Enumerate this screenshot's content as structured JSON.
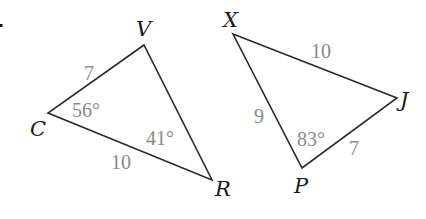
{
  "diagram": {
    "marker": ".",
    "triangles": [
      {
        "name": "CVR",
        "vertices": {
          "V": {
            "label": "V",
            "x": 144,
            "y": 45
          },
          "C": {
            "label": "C",
            "x": 48,
            "y": 113
          },
          "R": {
            "label": "R",
            "x": 212,
            "y": 180
          }
        },
        "sides": {
          "CV": {
            "label": "7"
          },
          "CR": {
            "label": "10"
          }
        },
        "angles": {
          "C": {
            "label": "56°"
          },
          "R": {
            "label": "41°"
          }
        }
      },
      {
        "name": "XJP",
        "vertices": {
          "X": {
            "label": "X",
            "x": 233,
            "y": 34
          },
          "J": {
            "label": "J",
            "x": 397,
            "y": 98
          },
          "P": {
            "label": "P",
            "x": 302,
            "y": 168
          }
        },
        "sides": {
          "XJ": {
            "label": "10"
          },
          "XP": {
            "label": "9"
          },
          "PJ": {
            "label": "7"
          }
        },
        "angles": {
          "P": {
            "label": "83°"
          }
        }
      }
    ]
  }
}
